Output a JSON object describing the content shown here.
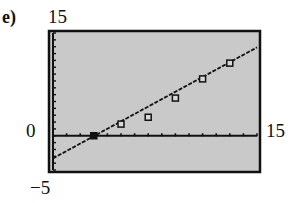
{
  "part_label": "e)",
  "window_labels": {
    "ymax": "15",
    "ymin": "−5",
    "xmin": "0",
    "xmax": "15"
  },
  "colors": {
    "screen_bg": "#c9c9c9",
    "frame": "#111111",
    "ink": "#111111"
  },
  "chart_data": {
    "type": "scatter",
    "title": "",
    "xlabel": "",
    "ylabel": "",
    "xlim": [
      0,
      15
    ],
    "ylim": [
      -5,
      15
    ],
    "xscale_tick": 1,
    "yscale_tick": 1,
    "grid": false,
    "legend": null,
    "series": [
      {
        "name": "data points",
        "marker": "square",
        "x": [
          3,
          5,
          7,
          9,
          11,
          13
        ],
        "y": [
          0,
          1.7,
          2.7,
          5.5,
          8.3,
          10.6
        ]
      },
      {
        "name": "regression line",
        "style": "line",
        "x": [
          0,
          15
        ],
        "y": [
          -3.3,
          12.9
        ]
      }
    ]
  }
}
